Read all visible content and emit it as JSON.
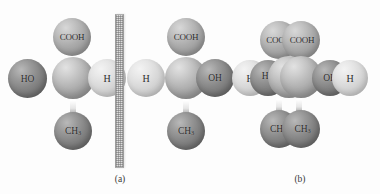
{
  "figure": {
    "background_color": "#fdfdfd",
    "panels": [
      {
        "id": "a",
        "caption": "(a)",
        "description": "two mirror-image ball-and-stick lactic acid molecules separated by a mirror plane",
        "mirror_plane": {
          "name": "mirror-plane",
          "style": "hatched vertical bar"
        },
        "molecules": [
          {
            "id": "left",
            "atoms": [
              {
                "label": "COOH",
                "position": "top",
                "shade": "mid"
              },
              {
                "label": "HO",
                "position": "left",
                "shade": "dark"
              },
              {
                "label": "",
                "position": "center",
                "shade": "carbon"
              },
              {
                "label": "H",
                "position": "right",
                "shade": "light"
              },
              {
                "label": "CH",
                "sub": "3",
                "position": "bottom",
                "shade": "dark"
              }
            ]
          },
          {
            "id": "right",
            "atoms": [
              {
                "label": "COOH",
                "position": "top",
                "shade": "mid"
              },
              {
                "label": "H",
                "position": "left",
                "shade": "light"
              },
              {
                "label": "",
                "position": "center",
                "shade": "carbon"
              },
              {
                "label": "OH",
                "position": "right",
                "shade": "dark"
              },
              {
                "label": "CH",
                "sub": "3",
                "position": "bottom",
                "shade": "dark"
              }
            ]
          }
        ]
      },
      {
        "id": "b",
        "caption": "(b)",
        "description": "the two enantiomers superimposed, showing non-superimposable groups",
        "atoms": [
          {
            "label": "COOH",
            "position": "top-left",
            "shade": "mid"
          },
          {
            "label": "COOH",
            "position": "top-right",
            "shade": "mid"
          },
          {
            "label": "H",
            "position": "far-left",
            "shade": "light"
          },
          {
            "label": "HO",
            "position": "inner-left",
            "shade": "dark"
          },
          {
            "label": "",
            "position": "center-left",
            "shade": "carbon"
          },
          {
            "label": "",
            "position": "center-right",
            "shade": "carbon"
          },
          {
            "label": "OH",
            "position": "inner-right",
            "shade": "dark"
          },
          {
            "label": "H",
            "position": "far-right",
            "shade": "light"
          },
          {
            "label": "CH",
            "sub": "3",
            "position": "bottom-left",
            "shade": "dark"
          },
          {
            "label": "CH",
            "sub": "3",
            "position": "bottom-right",
            "shade": "dark"
          }
        ]
      }
    ]
  }
}
